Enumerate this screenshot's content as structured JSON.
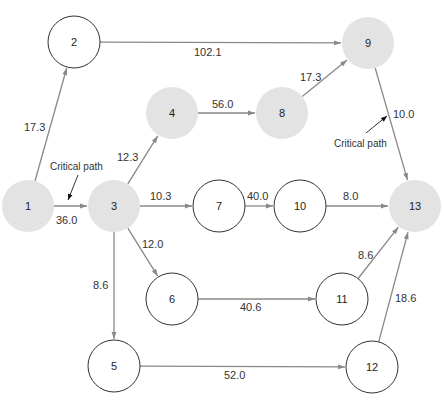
{
  "diagram": {
    "type": "network",
    "nodes": [
      {
        "id": "1",
        "label": "1",
        "x": 28,
        "y": 206,
        "critical": true
      },
      {
        "id": "2",
        "label": "2",
        "x": 74,
        "y": 42,
        "critical": false
      },
      {
        "id": "3",
        "label": "3",
        "x": 114,
        "y": 206,
        "critical": true
      },
      {
        "id": "4",
        "label": "4",
        "x": 172,
        "y": 113,
        "critical": true
      },
      {
        "id": "5",
        "label": "5",
        "x": 114,
        "y": 366,
        "critical": false
      },
      {
        "id": "6",
        "label": "6",
        "x": 172,
        "y": 299,
        "critical": false
      },
      {
        "id": "7",
        "label": "7",
        "x": 219,
        "y": 206,
        "critical": false
      },
      {
        "id": "8",
        "label": "8",
        "x": 282,
        "y": 113,
        "critical": true
      },
      {
        "id": "9",
        "label": "9",
        "x": 368,
        "y": 43,
        "critical": true
      },
      {
        "id": "10",
        "label": "10",
        "x": 300,
        "y": 206,
        "critical": false
      },
      {
        "id": "11",
        "label": "11",
        "x": 342,
        "y": 299,
        "critical": false
      },
      {
        "id": "12",
        "label": "12",
        "x": 372,
        "y": 367,
        "critical": false
      },
      {
        "id": "13",
        "label": "13",
        "x": 415,
        "y": 206,
        "critical": true
      }
    ],
    "edges": [
      {
        "from": "1",
        "to": "2",
        "label": "17.3",
        "lx": 24,
        "ly": 131
      },
      {
        "from": "1",
        "to": "3",
        "label": "36.0",
        "lx": 56,
        "ly": 224
      },
      {
        "from": "2",
        "to": "9",
        "label": "102.1",
        "lx": 194,
        "ly": 56
      },
      {
        "from": "3",
        "to": "4",
        "label": "12.3",
        "lx": 117,
        "ly": 161
      },
      {
        "from": "3",
        "to": "7",
        "label": "10.3",
        "lx": 150,
        "ly": 200
      },
      {
        "from": "3",
        "to": "6",
        "label": "12.0",
        "lx": 142,
        "ly": 248
      },
      {
        "from": "3",
        "to": "5",
        "label": "8.6",
        "lx": 93,
        "ly": 289
      },
      {
        "from": "4",
        "to": "8",
        "label": "56.0",
        "lx": 212,
        "ly": 108
      },
      {
        "from": "8",
        "to": "9",
        "label": "17.3",
        "lx": 300,
        "ly": 81
      },
      {
        "from": "9",
        "to": "13",
        "label": "10.0",
        "lx": 393,
        "ly": 118
      },
      {
        "from": "7",
        "to": "10",
        "label": "40.0",
        "lx": 247,
        "ly": 200
      },
      {
        "from": "10",
        "to": "13",
        "label": "8.0",
        "lx": 343,
        "ly": 200
      },
      {
        "from": "6",
        "to": "11",
        "label": "40.6",
        "lx": 240,
        "ly": 311
      },
      {
        "from": "11",
        "to": "13",
        "label": "8.6",
        "lx": 358,
        "ly": 259
      },
      {
        "from": "5",
        "to": "12",
        "label": "52.0",
        "lx": 224,
        "ly": 379
      },
      {
        "from": "12",
        "to": "13",
        "label": "18.6",
        "lx": 395,
        "ly": 302
      }
    ],
    "annotations": [
      {
        "text": "Critical path",
        "x": 50,
        "y": 170,
        "pointer": [
          [
            78,
            175
          ],
          [
            68,
            200
          ]
        ]
      },
      {
        "text": "Critical path",
        "x": 334,
        "y": 147,
        "pointer": [
          [
            366,
            133
          ],
          [
            387,
            116
          ]
        ]
      }
    ],
    "colors": {
      "critical_fill": "#e3e3e3",
      "normal_stroke": "#333333",
      "edge": "#888888"
    }
  }
}
